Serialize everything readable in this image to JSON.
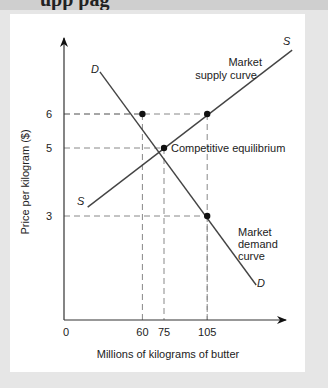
{
  "header_fragment": "upp pag",
  "chart_data": {
    "type": "line",
    "title": "",
    "xlabel": "Millions of kilograms of butter",
    "ylabel": "Price per kilogram ($)",
    "origin_label": "0",
    "x_ticks": [
      60,
      75,
      105
    ],
    "y_ticks": [
      6,
      5,
      3
    ],
    "xlim": [
      0,
      175
    ],
    "ylim": [
      0,
      8.3
    ],
    "series": [
      {
        "name": "Market supply curve",
        "label": "S",
        "points": [
          [
            22,
            3.26
          ],
          [
            164,
            7.88
          ]
        ]
      },
      {
        "name": "Market demand curve",
        "label": "D",
        "points": [
          [
            30.5,
            7.24
          ],
          [
            139,
            0.97
          ]
        ]
      }
    ],
    "points": [
      {
        "x": 60,
        "y": 6
      },
      {
        "x": 105,
        "y": 6
      },
      {
        "x": 75,
        "y": 5
      },
      {
        "x": 105,
        "y": 3
      }
    ],
    "guides": [
      {
        "x": 60,
        "y": 6
      },
      {
        "x": 105,
        "y": 6
      },
      {
        "x": 75,
        "y": 5
      },
      {
        "x": 105,
        "y": 3
      }
    ],
    "annotations": {
      "supply_title": [
        "Market",
        "supply curve"
      ],
      "demand_title": [
        "Market",
        "demand",
        "curve"
      ],
      "equilibrium": "Competitive equilibrium",
      "supply_label": "S",
      "demand_label": "D"
    },
    "grid": false,
    "legend": "none"
  }
}
